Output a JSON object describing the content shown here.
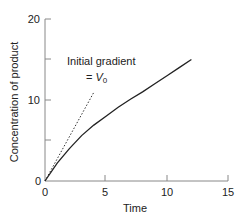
{
  "chart_data": {
    "type": "line",
    "title": "",
    "xlabel": "Time",
    "ylabel": "Concentration of product",
    "xlim": [
      0,
      15
    ],
    "ylim": [
      0,
      20
    ],
    "x_ticks": [
      "0",
      "5",
      "10",
      "15"
    ],
    "y_ticks": [
      "0",
      "10",
      "20"
    ],
    "y_minor_ticks": [
      5,
      15
    ],
    "grid": false,
    "legend": null,
    "series": [
      {
        "name": "Product concentration",
        "style": "solid",
        "x": [
          0,
          1,
          2,
          3,
          4,
          5,
          6,
          7,
          8,
          9,
          10,
          11,
          12
        ],
        "values": [
          0,
          2.2,
          4.0,
          5.6,
          6.9,
          8.0,
          9.1,
          10.1,
          11.0,
          12.0,
          13.0,
          14.0,
          15.0
        ]
      },
      {
        "name": "Initial gradient",
        "style": "dotted",
        "x": [
          0,
          4
        ],
        "values": [
          0,
          11
        ]
      }
    ],
    "annotations": [
      {
        "text_line1": "Initial gradient",
        "text_line2_prefix": "= ",
        "text_line2_symbol": "V",
        "text_line2_sub": "0"
      }
    ]
  }
}
